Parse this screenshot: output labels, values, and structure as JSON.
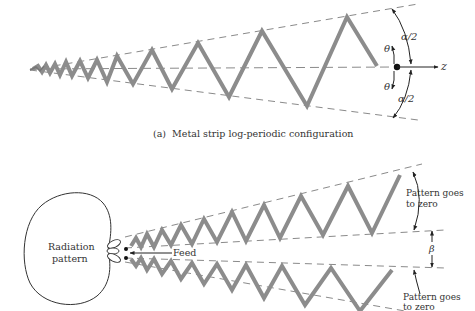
{
  "figure_a": {
    "caption": "(a)  Metal strip log-periodic configuration",
    "angle_upper": "α/2",
    "angle_lower": "α/2",
    "theta_upper": "θ",
    "theta_lower": "θ",
    "axis_label": "z"
  },
  "figure_b": {
    "pattern_label_line1": "Radiation",
    "pattern_label_line2": "pattern",
    "feed_label": "Feed",
    "upper_note_line1": "Pattern goes",
    "upper_note_line2": "to zero",
    "lower_note_line1": "Pattern goes",
    "lower_note_line2": "to zero",
    "beta_label": "β"
  },
  "colors": {
    "strip": "#8c8c8c",
    "dashed": "#8a8a8a",
    "ink": "#222222"
  }
}
